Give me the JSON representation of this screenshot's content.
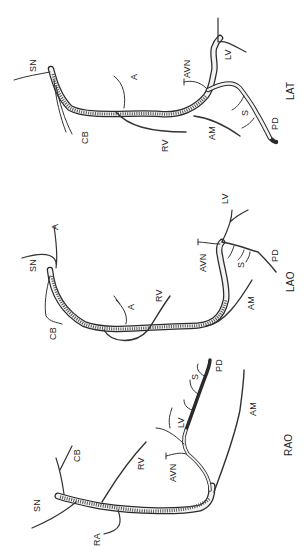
{
  "figure": {
    "orientation": "rotated 90 degrees counter-clockwise",
    "background": "#ffffff",
    "ink_color": "#2a2a2a"
  },
  "views": [
    {
      "id": "lat",
      "label": "LAT",
      "branch_labels": {
        "sn": "SN",
        "cb": "CB",
        "a": "A",
        "rv": "RV",
        "avn": "AVN",
        "am": "AM",
        "lv": "LV",
        "s": "S",
        "pd": "PD"
      }
    },
    {
      "id": "lao",
      "label": "LAO",
      "branch_labels": {
        "sn": "SN",
        "a_prox": "A",
        "cb": "CB",
        "a": "A",
        "rv": "RV",
        "avn": "AVN",
        "am": "AM",
        "lv": "LV",
        "s": "S",
        "pd": "PD"
      }
    },
    {
      "id": "rao",
      "label": "RAO",
      "branch_labels": {
        "sn": "SN",
        "ra": "RA",
        "cb": "CB",
        "rv": "RV",
        "avn": "AVN",
        "lv": "LV",
        "s": "S",
        "pd": "PD",
        "am": "AM"
      }
    }
  ]
}
